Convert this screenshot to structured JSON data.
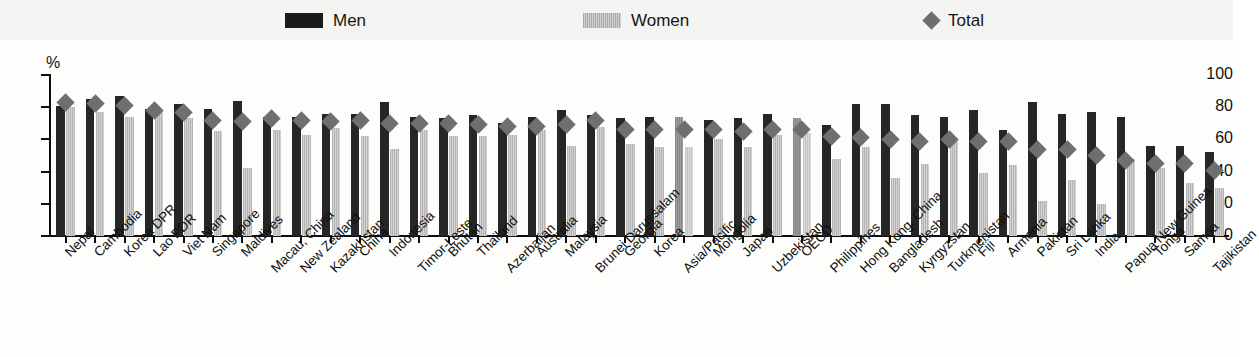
{
  "legend": {
    "items": [
      {
        "label": "Men",
        "icon": "men-swatch-icon",
        "color": "#1b1b1b"
      },
      {
        "label": "Women",
        "icon": "women-swatch-icon",
        "color": "#b9b9b9"
      },
      {
        "label": "Total",
        "icon": "total-diamond-icon",
        "color": "#6e6e6e"
      }
    ]
  },
  "axis": {
    "unit_label": "%",
    "y_ticks": [
      "100",
      "80",
      "60",
      "40",
      "20",
      "0"
    ]
  },
  "chart_data": {
    "type": "bar",
    "title": "",
    "xlabel": "",
    "ylabel": "%",
    "ylim": [
      0,
      100
    ],
    "ytick_values": [
      0,
      20,
      40,
      60,
      80,
      100
    ],
    "grid": false,
    "legend_position": "top",
    "categories": [
      "Nepal",
      "Cambodia",
      "Korea DPR",
      "Lao PDR",
      "Viet Nam",
      "Singapore",
      "Maldives",
      "Macau, China",
      "New Zealand",
      "Kazakhstan",
      "China",
      "Indonesia",
      "Timor-Leste",
      "Bhutan",
      "Thailand",
      "Azerbaijan",
      "Australia",
      "Malaysia",
      "Brunei Darussalam",
      "Georgia",
      "Korea",
      "Asia/Pacific",
      "Mongolia",
      "Japan",
      "Uzbekistan",
      "OECD",
      "Philippines",
      "Hong Kong, China",
      "Bangladesh",
      "Kyrgyzstan",
      "Turkmenistan",
      "Fiji",
      "Armenia",
      "Pakistan",
      "Sri Lanka",
      "India",
      "Papua New Guinea",
      "Tonga",
      "Samoa",
      "Tajikistan"
    ],
    "aggregate_categories": [
      "Asia/Pacific",
      "OECD"
    ],
    "series": [
      {
        "name": "Men",
        "values": [
          81,
          85,
          87,
          79,
          82,
          79,
          84,
          74,
          74,
          76,
          76,
          83,
          74,
          73,
          75,
          70,
          74,
          78,
          75,
          73,
          74,
          74,
          72,
          73,
          76,
          73,
          69,
          82,
          82,
          75,
          74,
          78,
          66,
          83,
          76,
          77,
          74,
          56,
          56,
          52
        ]
      },
      {
        "name": "Women",
        "values": [
          80,
          77,
          74,
          77,
          73,
          65,
          42,
          66,
          63,
          67,
          62,
          54,
          66,
          62,
          62,
          63,
          66,
          56,
          68,
          57,
          55,
          55,
          60,
          55,
          63,
          64,
          48,
          55,
          36,
          45,
          59,
          39,
          44,
          22,
          35,
          20,
          48,
          42,
          33,
          30
        ]
      }
    ],
    "total_series": {
      "name": "Total",
      "values": [
        83,
        82,
        81,
        78,
        77,
        72,
        71,
        73,
        72,
        71,
        72,
        70,
        70,
        70,
        69,
        68,
        68,
        69,
        72,
        66,
        66,
        66,
        66,
        65,
        66,
        66,
        62,
        61,
        60,
        59,
        60,
        59,
        59,
        54,
        54,
        50,
        47,
        45,
        45,
        41
      ]
    }
  }
}
